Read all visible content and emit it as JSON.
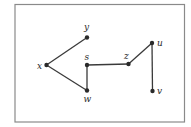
{
  "diagram": {
    "type": "graph",
    "directed": false,
    "frame": {
      "x": 15,
      "y": 4.5,
      "width": 169.5,
      "height": 117.5,
      "stroke": "#8a8a8a"
    },
    "edge_color": "#3a3a3a",
    "node_color": "#2a2a2a",
    "nodes": [
      {
        "id": "x",
        "label": "x",
        "cx": 46.5,
        "cy": 65,
        "lx": 37,
        "ly": 68.5
      },
      {
        "id": "y",
        "label": "y",
        "cx": 87,
        "cy": 37.5,
        "lx": 84,
        "ly": 30
      },
      {
        "id": "s",
        "label": "s",
        "cx": 87,
        "cy": 65,
        "lx": 84.5,
        "ly": 59.5
      },
      {
        "id": "w",
        "label": "w",
        "cx": 87,
        "cy": 90.5,
        "lx": 83.5,
        "ly": 102
      },
      {
        "id": "z",
        "label": "z",
        "cx": 128.5,
        "cy": 64,
        "lx": 124,
        "ly": 58.5
      },
      {
        "id": "u",
        "label": "u",
        "cx": 152,
        "cy": 43,
        "lx": 157,
        "ly": 46
      },
      {
        "id": "v",
        "label": "v",
        "cx": 152.5,
        "cy": 91,
        "lx": 157,
        "ly": 94
      }
    ],
    "edges": [
      {
        "from": "x",
        "to": "y"
      },
      {
        "from": "x",
        "to": "w"
      },
      {
        "from": "s",
        "to": "w"
      },
      {
        "from": "s",
        "to": "z"
      },
      {
        "from": "z",
        "to": "u"
      },
      {
        "from": "u",
        "to": "v"
      }
    ]
  }
}
